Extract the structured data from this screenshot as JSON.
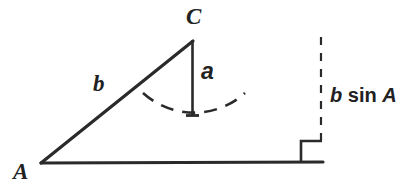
{
  "figure": {
    "background_color": "#ffffff",
    "stroke_color": "#2a2a2a",
    "labels": {
      "vertex_a": "A",
      "vertex_c": "C",
      "side_b": "b",
      "side_a": "a",
      "height_expr_var1": "b",
      "height_expr_fn": "sin",
      "height_expr_var2": "A",
      "height_expr_full": "b sin A"
    },
    "geometry": {
      "vertex_a_point": [
        41,
        163
      ],
      "vertex_c_point": [
        192,
        40
      ],
      "base_end_point": [
        323,
        162
      ],
      "altitude_foot_point": [
        192,
        116
      ],
      "dashed_line_top": [
        321,
        37
      ],
      "dashed_line_bottom": [
        321,
        141
      ],
      "right_angle_square": [
        301,
        141,
        21,
        21
      ],
      "arc_left_end": [
        143,
        93
      ],
      "arc_right_end": [
        245,
        93
      ],
      "arc_low_point": [
        194,
        116
      ]
    },
    "strokes": {
      "base_width": 3,
      "hypotenuse_width": 3,
      "altitude_width": 2.5,
      "dashed_width": 2,
      "arc_width": 2.5,
      "right_angle_width": 2.5
    }
  }
}
